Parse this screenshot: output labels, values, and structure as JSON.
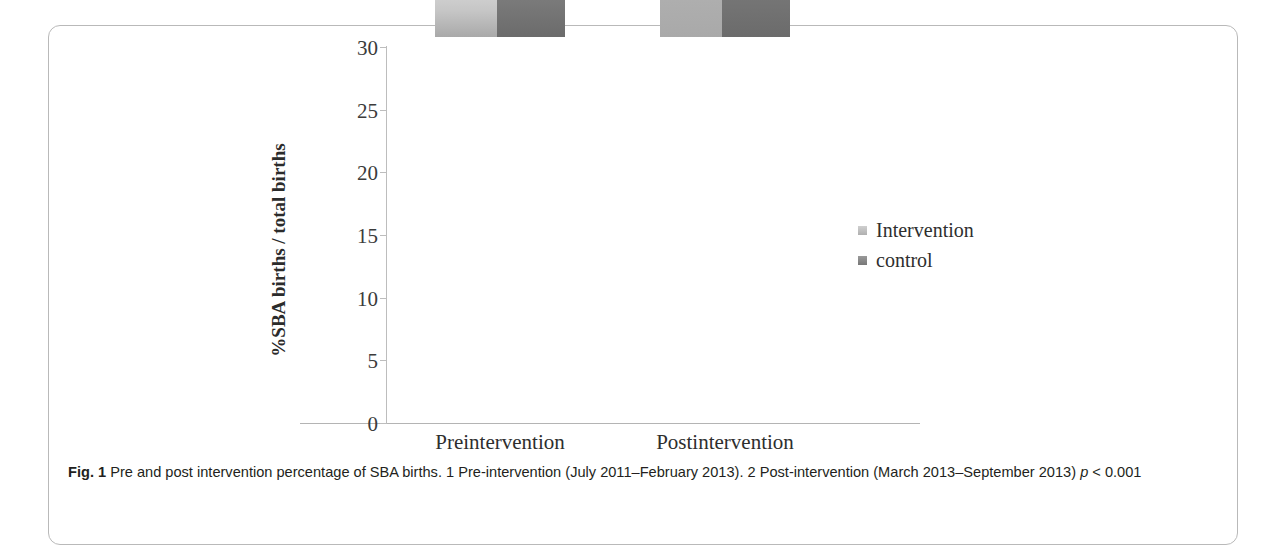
{
  "figure": {
    "caption_label": "Fig. 1",
    "caption_text": " Pre and post intervention percentage of SBA births. 1 Pre-intervention (July 2011–February 2013). 2 Post-intervention (March 2013–September 2013) ",
    "caption_stat_italic": "p",
    "caption_stat_rest": " < 0.001"
  },
  "chart_data": {
    "type": "bar",
    "title": "",
    "xlabel": "",
    "ylabel": "%SBA births / total births",
    "categories": [
      "Preintervention",
      "Postintervention"
    ],
    "series": [
      {
        "name": "Intervention",
        "values": [
          3.5,
          27.6
        ],
        "color": "#c6c6c6"
      },
      {
        "name": "control",
        "values": [
          10.2,
          16.0
        ],
        "color": "#8d8d8d"
      }
    ],
    "ylim": [
      0,
      30
    ],
    "yticks": [
      0,
      5,
      10,
      15,
      20,
      25,
      30
    ],
    "ytick_labels": [
      "0",
      "5",
      "10",
      "15",
      "20",
      "25",
      "30"
    ],
    "grid": false,
    "legend_position": "right"
  },
  "legend": {
    "items": [
      {
        "label": "Intervention",
        "swatch_name": "legend-swatch-intervention"
      },
      {
        "label": "control",
        "swatch_name": "legend-swatch-control"
      }
    ]
  }
}
